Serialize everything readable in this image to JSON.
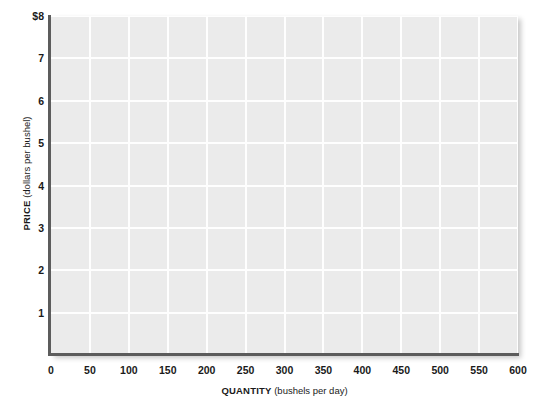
{
  "chart_data": {
    "type": "line",
    "title": "",
    "subtitle": "",
    "xlabel_bold": "QUANTITY",
    "xlabel_rest": " (bushels per day)",
    "ylabel_bold": "PRICE",
    "ylabel_rest": " (dollars per bushel)",
    "xlim": [
      0,
      600
    ],
    "ylim": [
      0,
      8
    ],
    "x_ticks": [
      0,
      50,
      100,
      150,
      200,
      250,
      300,
      350,
      400,
      450,
      500,
      550,
      600
    ],
    "x_tick_labels": [
      "0",
      "50",
      "100",
      "150",
      "200",
      "250",
      "300",
      "350",
      "400",
      "450",
      "500",
      "550",
      "600"
    ],
    "y_ticks": [
      1,
      2,
      3,
      4,
      5,
      6,
      7,
      8
    ],
    "y_tick_labels": [
      "1",
      "2",
      "3",
      "4",
      "5",
      "6",
      "7",
      "$8"
    ],
    "grid": true,
    "grid_color": "#fefefe",
    "plot_background": "#ebebeb",
    "axis_color": "#5c5c5c",
    "legend": [],
    "series": [],
    "annotations": [],
    "note": "empty grid; no data series plotted"
  }
}
